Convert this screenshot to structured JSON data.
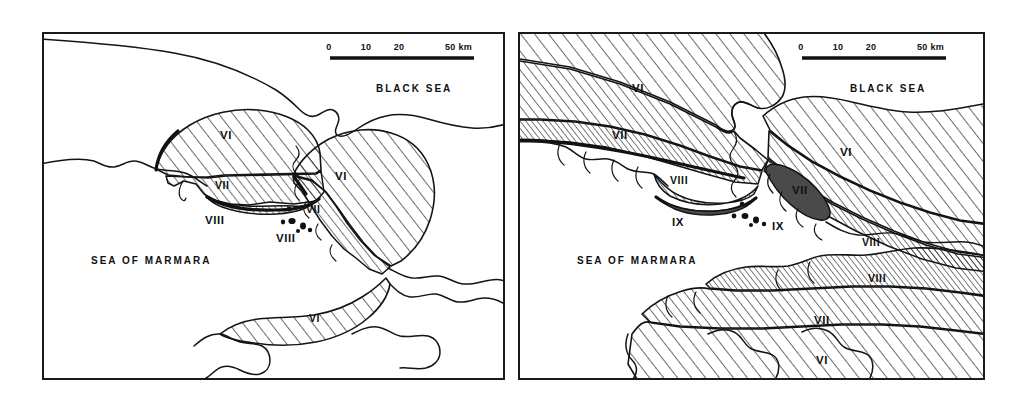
{
  "figure": {
    "background_color": "#ffffff",
    "ink_color": "#111111",
    "panel_count": 2
  },
  "panels": [
    {
      "id": "left",
      "name": "left-map",
      "sea_labels": [
        {
          "text": "BLACK SEA",
          "x": 332,
          "y": 58
        },
        {
          "text": "SEA OF MARMARA",
          "x": 47,
          "y": 230
        }
      ],
      "scale": {
        "ticks": [
          "0",
          "10",
          "20"
        ],
        "tick_x": [
          285,
          322,
          355
        ],
        "end_label": "50 km",
        "end_x": 400,
        "bar_x1": 286,
        "bar_x2": 430,
        "bar_y": 24,
        "label_y": 16
      },
      "zone_labels": [
        {
          "text": "VI",
          "x": 176,
          "y": 105,
          "size": "roman"
        },
        {
          "text": "VII",
          "x": 171,
          "y": 150,
          "size": "roman-small"
        },
        {
          "text": "VIII",
          "x": 161,
          "y": 178,
          "size": "roman"
        },
        {
          "text": "VI",
          "x": 291,
          "y": 146,
          "size": "roman"
        },
        {
          "text": "VII",
          "x": 278,
          "y": 181,
          "size": "roman-small"
        },
        {
          "text": "VIII",
          "x": 240,
          "y": 211,
          "size": "roman"
        },
        {
          "text": "VI",
          "x": 277,
          "y": 281,
          "size": "roman-small"
        }
      ]
    },
    {
      "id": "right",
      "name": "right-map",
      "sea_labels": [
        {
          "text": "BLACK SEA",
          "x": 330,
          "y": 58
        },
        {
          "text": "SEA OF MARMARA",
          "x": 57,
          "y": 230
        }
      ],
      "scale": {
        "ticks": [
          "0",
          "10",
          "20"
        ],
        "tick_x": [
          281,
          318,
          351
        ],
        "end_label": "50 km",
        "end_x": 396,
        "bar_x1": 282,
        "bar_x2": 426,
        "bar_y": 24,
        "label_y": 16
      },
      "zone_labels": [
        {
          "text": "VI",
          "x": 120,
          "y": 54,
          "size": "roman"
        },
        {
          "text": "VII",
          "x": 100,
          "y": 101,
          "size": "roman"
        },
        {
          "text": "VIII",
          "x": 158,
          "y": 146,
          "size": "roman-small"
        },
        {
          "text": "IX",
          "x": 158,
          "y": 177,
          "size": "roman"
        },
        {
          "text": "VI",
          "x": 326,
          "y": 118,
          "size": "roman"
        },
        {
          "text": "VII",
          "x": 283,
          "y": 157,
          "size": "roman"
        },
        {
          "text": "IX",
          "x": 263,
          "y": 201,
          "size": "roman"
        },
        {
          "text": "VIII",
          "x": 353,
          "y": 207,
          "size": "roman-small"
        },
        {
          "text": "VIII",
          "x": 358,
          "y": 263,
          "size": "roman-small"
        },
        {
          "text": "VII",
          "x": 305,
          "y": 297,
          "size": "roman"
        },
        {
          "text": "VI",
          "x": 305,
          "y": 337,
          "size": "roman"
        }
      ]
    }
  ]
}
